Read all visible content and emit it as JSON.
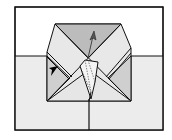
{
  "diagram": {
    "type": "origami-step",
    "colors": {
      "background": "#ffffff",
      "table": "#ececec",
      "top_flap": "#bcbcbc",
      "side_flap": "#d2d2d2",
      "light_flap": "#e8e8e8",
      "line": "#111111",
      "arrow_dark": "#000000",
      "arrow_gray": "#555555"
    },
    "frame": {
      "x": 15,
      "y": 7,
      "w": 148,
      "h": 123
    },
    "table_line_y": 56,
    "center_line_x": 89,
    "arrows": [
      {
        "name": "push-in-arrow",
        "style": "black-filled",
        "tip": [
          57,
          66
        ]
      },
      {
        "name": "lift-up-arrow",
        "style": "gray-outline",
        "from": [
          88,
          58
        ],
        "to": [
          94,
          32
        ]
      }
    ]
  }
}
